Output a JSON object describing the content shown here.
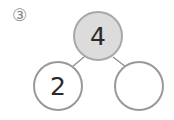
{
  "problem": {
    "label": "③",
    "top": {
      "value": "4",
      "fill": "#dcdcdc",
      "stroke": "#a8a8a8"
    },
    "left": {
      "value": "2",
      "fill": "#ffffff",
      "stroke": "#999999"
    },
    "right": {
      "value": "",
      "fill": "#ffffff",
      "stroke": "#999999"
    }
  }
}
